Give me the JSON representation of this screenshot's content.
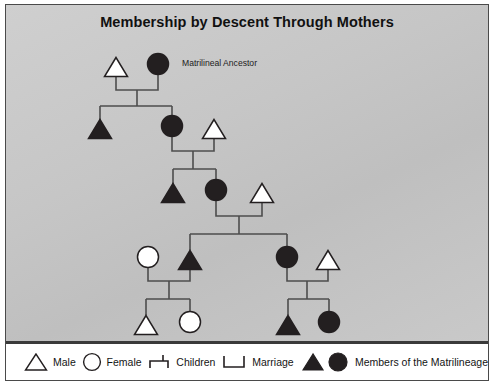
{
  "diagram": {
    "title": "Membership by Descent Through Mothers",
    "type": "kinship-chart",
    "annotations": [
      {
        "text": "Matrilineal Ancestor",
        "x": 176,
        "y": 61
      }
    ],
    "symbols": {
      "male": "triangle",
      "female": "circle",
      "lineage_member_fill": "#231f20",
      "non_member_fill": "#ffffff",
      "stroke": "#231f20",
      "line_color": "#4d4d4d"
    },
    "generations": [
      {
        "id": "g1",
        "people": [
          {
            "id": "g1-m",
            "shape": "triangle",
            "sex": "male",
            "lineage": false,
            "x": 110,
            "y": 62
          },
          {
            "id": "g1-f",
            "shape": "circle",
            "sex": "female",
            "lineage": true,
            "x": 152,
            "y": 59
          }
        ]
      },
      {
        "id": "g2",
        "people": [
          {
            "id": "g2-a",
            "shape": "triangle",
            "sex": "male",
            "lineage": true,
            "x": 94,
            "y": 124
          },
          {
            "id": "g2-b",
            "shape": "circle",
            "sex": "female",
            "lineage": true,
            "x": 166,
            "y": 121
          },
          {
            "id": "g2-c",
            "shape": "triangle",
            "sex": "male",
            "lineage": false,
            "x": 208,
            "y": 124
          }
        ]
      },
      {
        "id": "g3",
        "people": [
          {
            "id": "g3-a",
            "shape": "triangle",
            "sex": "male",
            "lineage": true,
            "x": 167,
            "y": 188
          },
          {
            "id": "g3-b",
            "shape": "circle",
            "sex": "female",
            "lineage": true,
            "x": 210,
            "y": 185
          },
          {
            "id": "g3-c",
            "shape": "triangle",
            "sex": "male",
            "lineage": false,
            "x": 256,
            "y": 188
          }
        ]
      },
      {
        "id": "g4",
        "people": [
          {
            "id": "g4-a",
            "shape": "circle",
            "sex": "female",
            "lineage": false,
            "x": 142,
            "y": 252
          },
          {
            "id": "g4-b",
            "shape": "triangle",
            "sex": "male",
            "lineage": true,
            "x": 184,
            "y": 255
          },
          {
            "id": "g4-c",
            "shape": "circle",
            "sex": "female",
            "lineage": true,
            "x": 281,
            "y": 252
          },
          {
            "id": "g4-d",
            "shape": "triangle",
            "sex": "male",
            "lineage": false,
            "x": 322,
            "y": 255
          }
        ]
      },
      {
        "id": "g5",
        "people": [
          {
            "id": "g5-a",
            "shape": "triangle",
            "sex": "male",
            "lineage": false,
            "x": 140,
            "y": 320
          },
          {
            "id": "g5-b",
            "shape": "circle",
            "sex": "female",
            "lineage": false,
            "x": 184,
            "y": 317
          },
          {
            "id": "g5-c",
            "shape": "triangle",
            "sex": "male",
            "lineage": true,
            "x": 282,
            "y": 320
          },
          {
            "id": "g5-d",
            "shape": "circle",
            "sex": "female",
            "lineage": true,
            "x": 323,
            "y": 317
          }
        ]
      }
    ],
    "links": [
      {
        "type": "marriage",
        "from": "g1-m",
        "to": "g1-f",
        "y": 85,
        "x1": 110,
        "x2": 152
      },
      {
        "type": "descent",
        "stem_x": 131,
        "stem_y1": 85,
        "stem_y2": 101,
        "bar_y": 101,
        "bar_x1": 94,
        "bar_x2": 166,
        "children_x": [
          94,
          166
        ]
      },
      {
        "type": "marriage",
        "from": "g2-b",
        "to": "g2-c",
        "y": 146,
        "x1": 166,
        "x2": 208
      },
      {
        "type": "descent",
        "stem_x": 187,
        "stem_y1": 146,
        "stem_y2": 164,
        "bar_y": 164,
        "bar_x1": 167,
        "bar_x2": 210,
        "children_x": [
          167,
          210
        ]
      },
      {
        "type": "marriage",
        "from": "g3-b",
        "to": "g3-c",
        "y": 211,
        "x1": 210,
        "x2": 256
      },
      {
        "type": "descent",
        "stem_x": 233,
        "stem_y1": 211,
        "stem_y2": 229,
        "bar_y": 229,
        "bar_x1": 184,
        "bar_x2": 281,
        "children_x": [
          184,
          281
        ]
      },
      {
        "type": "marriage",
        "from": "g4-a",
        "to": "g4-b",
        "y": 276,
        "x1": 142,
        "x2": 184
      },
      {
        "type": "descent",
        "stem_x": 163,
        "stem_y1": 276,
        "stem_y2": 294,
        "bar_y": 294,
        "bar_x1": 140,
        "bar_x2": 184,
        "children_x": [
          140,
          184
        ]
      },
      {
        "type": "marriage",
        "from": "g4-c",
        "to": "g4-d",
        "y": 276,
        "x1": 281,
        "x2": 322
      },
      {
        "type": "descent",
        "stem_x": 301,
        "stem_y1": 276,
        "stem_y2": 294,
        "bar_y": 294,
        "bar_x1": 282,
        "bar_x2": 323,
        "children_x": [
          282,
          323
        ]
      }
    ]
  },
  "legend": {
    "items": [
      {
        "icon": "triangle-outline-icon",
        "label": "Male"
      },
      {
        "icon": "circle-outline-icon",
        "label": "Female"
      },
      {
        "icon": "children-link-icon",
        "label": "Children"
      },
      {
        "icon": "marriage-link-icon",
        "label": "Marriage"
      },
      {
        "icon": "filled-triangle-and-circle-icon",
        "label": "Members of the Matrilineage"
      }
    ]
  }
}
